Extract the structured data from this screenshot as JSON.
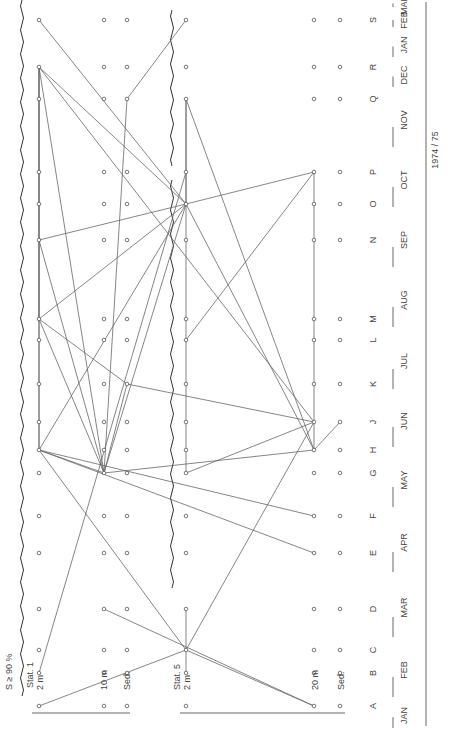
{
  "figure": {
    "criterion_label": "S ≥ 90 %",
    "year_label": "1974 / 75",
    "stations": [
      {
        "label": "Stat. 1",
        "depths": [
          {
            "key": "s1_2m",
            "label": "2 m",
            "x": 39
          },
          {
            "key": "s1_10m",
            "label": "10 m",
            "x": 104
          },
          {
            "key": "s1_sed",
            "label": "Sed.",
            "x": 127
          }
        ]
      },
      {
        "label": "Stat. 5",
        "depths": [
          {
            "key": "s5_2m",
            "label": "2 m",
            "x": 186
          },
          {
            "key": "s5_20m",
            "label": "20 m",
            "x": 314
          },
          {
            "key": "s5_sed",
            "label": "Sed.",
            "x": 340
          }
        ]
      }
    ],
    "samples": [
      {
        "letter": "A",
        "y": 706
      },
      {
        "letter": "B",
        "y": 673
      },
      {
        "letter": "C",
        "y": 650
      },
      {
        "letter": "D",
        "y": 609
      },
      {
        "letter": "E",
        "y": 553
      },
      {
        "letter": "F",
        "y": 516
      },
      {
        "letter": "G",
        "y": 473
      },
      {
        "letter": "H",
        "y": 450
      },
      {
        "letter": "J",
        "y": 422
      },
      {
        "letter": "K",
        "y": 384
      },
      {
        "letter": "L",
        "y": 340
      },
      {
        "letter": "M",
        "y": 319
      },
      {
        "letter": "N",
        "y": 240
      },
      {
        "letter": "O",
        "y": 204
      },
      {
        "letter": "P",
        "y": 172
      },
      {
        "letter": "Q",
        "y": 99
      },
      {
        "letter": "R",
        "y": 67
      },
      {
        "letter": "S",
        "y": 20
      }
    ],
    "months": [
      {
        "label": "JAN",
        "y0": 700,
        "y1": 731
      },
      {
        "label": "FEB",
        "y0": 640,
        "y1": 700
      },
      {
        "label": "MAR",
        "y0": 575,
        "y1": 640
      },
      {
        "label": "APR",
        "y0": 510,
        "y1": 575
      },
      {
        "label": "MAY",
        "y0": 450,
        "y1": 510
      },
      {
        "label": "JUN",
        "y0": 392,
        "y1": 450
      },
      {
        "label": "JUL",
        "y0": 330,
        "y1": 392
      },
      {
        "label": "AUG",
        "y0": 270,
        "y1": 330
      },
      {
        "label": "SEP",
        "y0": 210,
        "y1": 270
      },
      {
        "label": "OCT",
        "y0": 150,
        "y1": 210
      },
      {
        "label": "NOV",
        "y0": 90,
        "y1": 150
      },
      {
        "label": "DEC",
        "y0": 60,
        "y1": 90
      },
      {
        "label": "JAN",
        "y0": 30,
        "y1": 60
      },
      {
        "label": "FEB",
        "y0": 10,
        "y1": 30
      },
      {
        "label": "MAR",
        "y0": 0,
        "y1": 10
      }
    ],
    "edges": [
      [
        "s1_2m:A",
        "s5_2m:C"
      ],
      [
        "s1_2m:B",
        "s5_2m:P"
      ],
      [
        "s1_2m:R",
        "s1_2m:N"
      ],
      [
        "s1_2m:R",
        "s1_2m:M"
      ],
      [
        "s1_2m:R",
        "s1_2m:H"
      ],
      [
        "s1_2m:R",
        "s1_10m:G"
      ],
      [
        "s1_2m:R",
        "s5_2m:O"
      ],
      [
        "s1_2m:R",
        "s5_20m:J"
      ],
      [
        "s1_2m:N",
        "s1_2m:M"
      ],
      [
        "s1_2m:N",
        "s5_2m:O"
      ],
      [
        "s1_2m:N",
        "s1_10m:G"
      ],
      [
        "s1_2m:M",
        "s5_2m:O"
      ],
      [
        "s1_2m:M",
        "s1_10m:G"
      ],
      [
        "s1_2m:M",
        "s1_sed:K"
      ],
      [
        "s1_2m:H",
        "s1_2m:M"
      ],
      [
        "s1_2m:H",
        "s5_2m:O"
      ],
      [
        "s1_2m:H",
        "s1_10m:G"
      ],
      [
        "s1_2m:H",
        "s5_20m:F"
      ],
      [
        "s1_2m:H",
        "s5_20m:E"
      ],
      [
        "s1_10m:G",
        "s5_2m:O"
      ],
      [
        "s1_10m:G",
        "s1_sed:K"
      ],
      [
        "s1_10m:G",
        "s1_sed:Q"
      ],
      [
        "s1_10m:G",
        "s5_20m:H"
      ],
      [
        "s1_10m:D",
        "s5_20m:A"
      ],
      [
        "s1_sed:K",
        "s5_20m:J"
      ],
      [
        "s1_sed:Q",
        "s5_2m:S"
      ],
      [
        "s5_2m:O",
        "s5_2m:Q"
      ],
      [
        "s5_2m:O",
        "s5_20m:P"
      ],
      [
        "s5_2m:O",
        "s5_20m:H"
      ],
      [
        "s5_2m:O",
        "s1_2m:S"
      ],
      [
        "s5_2m:Q",
        "s5_2m:G"
      ],
      [
        "s5_2m:Q",
        "s5_20m:H"
      ],
      [
        "s5_2m:G",
        "s5_20m:J"
      ],
      [
        "s5_2m:L",
        "s5_20m:P"
      ],
      [
        "s5_2m:C",
        "s5_2m:B"
      ],
      [
        "s5_2m:C",
        "s5_2m:D"
      ],
      [
        "s5_2m:C",
        "s5_20m:A"
      ],
      [
        "s5_2m:C",
        "s5_20m:J"
      ],
      [
        "s5_2m:C",
        "s1_2m:H"
      ],
      [
        "s5_20m:H",
        "s5_20m:P"
      ],
      [
        "s5_20m:H",
        "s5_sed:J"
      ]
    ]
  }
}
